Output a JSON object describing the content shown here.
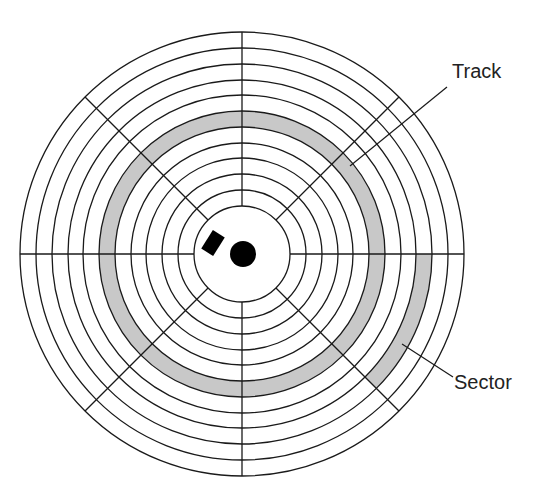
{
  "diagram": {
    "labels": {
      "track": "Track",
      "sector": "Sector"
    },
    "colors": {
      "line": "#1a1a1a",
      "shade": "#c8c8c8",
      "background": "#ffffff",
      "hub": "#000000"
    },
    "geometry": {
      "center": [
        242,
        254
      ],
      "ring_radii": [
        48,
        64,
        80,
        96,
        111,
        127,
        143,
        159,
        174,
        190,
        206,
        222
      ],
      "sector_divider_angles_deg": [
        0,
        45,
        90,
        135,
        180,
        225,
        270,
        315
      ],
      "highlighted_track": {
        "inner_radius": 127,
        "outer_radius": 143
      },
      "highlighted_sector": {
        "inner_radius": 174,
        "outer_radius": 190,
        "start_deg": 0,
        "end_deg": 45
      }
    }
  }
}
